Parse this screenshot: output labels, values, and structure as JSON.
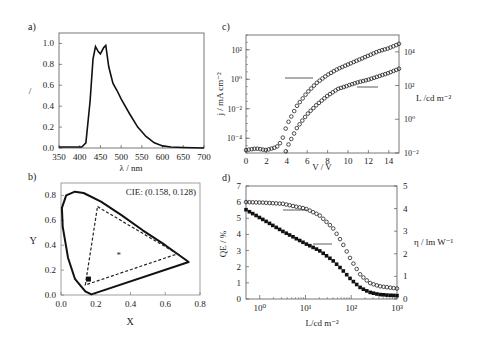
{
  "chart_data": [
    {
      "panel": "a)",
      "type": "line",
      "title": "",
      "xlabel": "λ / nm",
      "ylabel": "/",
      "xlim": [
        350,
        700
      ],
      "ylim": [
        0.0,
        1.1
      ],
      "xticks": [
        "350",
        "400",
        "450",
        "500",
        "550",
        "600",
        "650",
        "700"
      ],
      "yticks": [
        "0.0",
        "0.2",
        "0.4",
        "0.6",
        "0.8",
        "1.0"
      ],
      "grid": false,
      "series": [
        {
          "name": "EL spectrum",
          "x": [
            350,
            380,
            405,
            415,
            425,
            432,
            438,
            445,
            450,
            458,
            463,
            470,
            480,
            490,
            500,
            520,
            540,
            560,
            580,
            600,
            620,
            650,
            700
          ],
          "y": [
            0.01,
            0.01,
            0.01,
            0.05,
            0.45,
            0.85,
            0.97,
            0.92,
            0.9,
            0.96,
            0.98,
            0.78,
            0.62,
            0.55,
            0.47,
            0.33,
            0.2,
            0.11,
            0.05,
            0.02,
            0.01,
            0.005,
            0.0
          ]
        }
      ]
    },
    {
      "panel": "b)",
      "type": "scatter",
      "title": "",
      "xlabel": "X",
      "ylabel": "Y",
      "xlim": [
        0.0,
        0.8
      ],
      "ylim": [
        0.0,
        0.9
      ],
      "xticks": [
        "0.0",
        "0.2",
        "0.4",
        "0.6",
        "0.8"
      ],
      "yticks": [
        "0.0",
        "0.2",
        "0.4",
        "0.6",
        "0.8"
      ],
      "annotation": "CIE: (0.158, 0.128)",
      "point": {
        "x": 0.158,
        "y": 0.128
      },
      "white_point": {
        "x": 0.333,
        "y": 0.333
      },
      "triangle": [
        [
          0.21,
          0.71
        ],
        [
          0.67,
          0.33
        ],
        [
          0.14,
          0.08
        ]
      ],
      "locus": [
        [
          0.175,
          0.005
        ],
        [
          0.14,
          0.03
        ],
        [
          0.08,
          0.13
        ],
        [
          0.04,
          0.3
        ],
        [
          0.01,
          0.55
        ],
        [
          0.005,
          0.7
        ],
        [
          0.03,
          0.8
        ],
        [
          0.08,
          0.83
        ],
        [
          0.13,
          0.82
        ],
        [
          0.23,
          0.75
        ],
        [
          0.35,
          0.64
        ],
        [
          0.47,
          0.52
        ],
        [
          0.6,
          0.4
        ],
        [
          0.735,
          0.265
        ],
        [
          0.175,
          0.005
        ]
      ]
    },
    {
      "panel": "c)",
      "type": "scatter",
      "title": "",
      "xlabel": "V / V",
      "ylabel": "j / mA cm⁻²",
      "ylabel_right": "L /cd m⁻²",
      "xlim": [
        0,
        15
      ],
      "ylim_log": [
        -5,
        3
      ],
      "ylim_right_log": [
        -2,
        5
      ],
      "xticks": [
        "0",
        "2",
        "4",
        "6",
        "8",
        "10",
        "12",
        "14"
      ],
      "yticks": [
        "10⁻⁴",
        "10⁻²",
        "10⁰",
        "10²"
      ],
      "yticks_right": [
        "10⁻²",
        "10⁰",
        "10²",
        "10⁴"
      ],
      "series": [
        {
          "name": "j (left axis)",
          "x": [
            0,
            1,
            2,
            3,
            3.5,
            4,
            5,
            6,
            7,
            8,
            9,
            10,
            11,
            12,
            13,
            14,
            15
          ],
          "log10_y": [
            -4.8,
            -4.7,
            -4.8,
            -4.6,
            -4.2,
            -3.1,
            -1.8,
            -0.9,
            -0.2,
            0.3,
            0.7,
            1.0,
            1.3,
            1.6,
            1.9,
            2.1,
            2.4
          ]
        },
        {
          "name": "L (right axis)",
          "x": [
            3.9,
            4,
            5,
            6,
            7,
            8,
            9,
            10,
            11,
            12,
            13,
            14,
            15
          ],
          "log10_y": [
            -1.9,
            -1.7,
            -0.5,
            0.3,
            0.9,
            1.4,
            1.8,
            2.0,
            2.2,
            2.35,
            2.55,
            2.75,
            3.0
          ]
        }
      ]
    },
    {
      "panel": "d)",
      "type": "scatter",
      "title": "",
      "xlabel": "L/cd m⁻²",
      "ylabel": "QE / %",
      "ylabel_right": "η / lm W⁻¹",
      "xlim_log": [
        -0.3,
        3
      ],
      "ylim": [
        0,
        7
      ],
      "ylim_right": [
        0,
        5
      ],
      "xticks": [
        "10⁰",
        "10¹",
        "10²",
        "10³"
      ],
      "yticks": [
        "0",
        "1",
        "2",
        "3",
        "4",
        "5",
        "6",
        "7"
      ],
      "yticks_right": [
        "0",
        "1",
        "2",
        "3",
        "4",
        "5"
      ],
      "series": [
        {
          "name": "QE (open circles, left axis)",
          "log10_x": [
            -0.3,
            0,
            0.5,
            1,
            1.3,
            1.6,
            1.8,
            2.0,
            2.2,
            2.4,
            2.6,
            2.8,
            3.0
          ],
          "y": [
            6.0,
            5.98,
            5.9,
            5.6,
            5.2,
            4.4,
            3.5,
            2.4,
            1.5,
            1.0,
            0.8,
            0.72,
            0.65
          ]
        },
        {
          "name": "η (filled squares, right axis)",
          "log10_x": [
            -0.3,
            0,
            0.5,
            1,
            1.3,
            1.6,
            1.8,
            2.0,
            2.2,
            2.4,
            2.6,
            2.8,
            3.0
          ],
          "y": [
            3.95,
            3.6,
            3.0,
            2.45,
            2.15,
            1.7,
            1.3,
            0.85,
            0.5,
            0.3,
            0.2,
            0.17,
            0.15
          ]
        }
      ]
    }
  ],
  "labels": {
    "a": {
      "panel": "a)",
      "xlabel": "λ / nm",
      "ylabel": "/",
      "xticks": [
        "350",
        "400",
        "450",
        "500",
        "550",
        "600",
        "650",
        "700"
      ],
      "yticks": [
        "0.0",
        "0.2",
        "0.4",
        "0.6",
        "0.8",
        "1.0"
      ]
    },
    "b": {
      "panel": "b)",
      "xlabel": "X",
      "ylabel": "Y",
      "annotation": "CIE: (0.158, 0.128)",
      "xticks": [
        "0.0",
        "0.2",
        "0.4",
        "0.6",
        "0.8"
      ],
      "yticks": [
        "0.0",
        "0.2",
        "0.4",
        "0.6",
        "0.8"
      ]
    },
    "c": {
      "panel": "c)",
      "xlabel": "V / V",
      "ylabel": "j / mA cm⁻²",
      "ylabel_right": "L /cd m⁻²",
      "xticks": [
        "0",
        "2",
        "4",
        "6",
        "8",
        "10",
        "12",
        "14"
      ],
      "yticks": [
        "10⁻⁴",
        "10⁻²",
        "10⁰",
        "10²"
      ],
      "yticks_right": [
        "10⁻²",
        "10⁰",
        "10²",
        "10⁴"
      ]
    },
    "d": {
      "panel": "d)",
      "xlabel": "L/cd m⁻²",
      "ylabel": "QE / %",
      "ylabel_right": "η / lm W⁻¹",
      "xticks": [
        "10⁰",
        "10¹",
        "10²",
        "10³"
      ],
      "yticks": [
        "0",
        "1",
        "2",
        "3",
        "4",
        "5",
        "6",
        "7"
      ],
      "yticks_right": [
        "0",
        "1",
        "2",
        "3",
        "4",
        "5"
      ]
    }
  }
}
